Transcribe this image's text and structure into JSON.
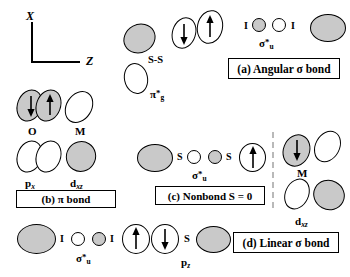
{
  "figure": {
    "axes": {
      "x_label": "X",
      "z_label": "Z"
    },
    "panels": [
      {
        "id": "a",
        "label": "(a) Angular σ bond"
      },
      {
        "id": "b",
        "label": "(b) π bond"
      },
      {
        "id": "c",
        "label": "(c) Nonbond S = 0"
      },
      {
        "id": "d",
        "label": "(d) Linear σ bond"
      }
    ],
    "atom_labels": {
      "oxygen": "O",
      "metal_top": "M",
      "metal_right": "M",
      "iodine_a_left": "I",
      "iodine_a_right": "I",
      "iodine_d_left": "I",
      "iodine_d_right": "I",
      "sulfur_c_left": "S",
      "sulfur_c_right": "S",
      "sulfur_d": "S",
      "ss_pair": "S-S"
    },
    "orbital_labels": {
      "pi_star_g": {
        "base": "π",
        "star": "*",
        "sub": "g"
      },
      "sigma_star_u_a": {
        "base": "σ",
        "star": "*",
        "sub": "u"
      },
      "sigma_star_u_c": {
        "base": "σ",
        "star": "*",
        "sub": "u"
      },
      "sigma_star_u_d": {
        "base": "σ",
        "star": "*",
        "sub": "u"
      },
      "p_x": {
        "base": "p",
        "sub": "x"
      },
      "d_xz_b": {
        "base": "d",
        "sub": "xz"
      },
      "d_xz_d": {
        "base": "d",
        "sub": "xz"
      },
      "p_z": {
        "base": "p",
        "sub": "z"
      }
    },
    "colors": {
      "filled_lobe": "#c9c9c9",
      "empty_lobe": "#ffffff",
      "stroke": "#000000",
      "divider": "#b9b9b9"
    }
  }
}
